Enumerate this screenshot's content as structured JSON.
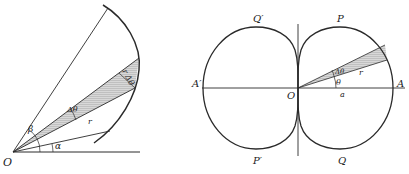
{
  "left_figure": {
    "labels": {
      "origin": "O",
      "beta": "β",
      "alpha": "α",
      "delta_theta": "Δθ",
      "radius": "r",
      "arc_element": "r Δθ"
    }
  },
  "right_figure": {
    "labels": {
      "origin": "O",
      "A": "A",
      "A_prime": "A′",
      "P": "P",
      "Q": "Q",
      "P_prime": "P′",
      "Q_prime": "Q′",
      "theta": "θ",
      "delta_theta": "Δθ",
      "radius": "r",
      "a": "a"
    }
  },
  "colors": {
    "line": "#2a2a2a",
    "shade": "#bdbdbd"
  }
}
